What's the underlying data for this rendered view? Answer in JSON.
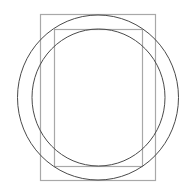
{
  "canvas": {
    "width": 192,
    "height": 194,
    "background": "#ffffff"
  },
  "colors": {
    "rect_stroke": "#a8a8a8",
    "circle_stroke": "#4a4a4a"
  },
  "shapes": {
    "outer_rect": {
      "x": 40.5,
      "y": 14.5,
      "width": 115,
      "height": 166
    },
    "inner_rect": {
      "x": 54.5,
      "y": 29.5,
      "width": 88,
      "height": 137
    },
    "outer_circle": {
      "cx": 98,
      "cy": 97.5,
      "rx": 80.5,
      "ry": 82.5
    },
    "inner_circle": {
      "cx": 98.5,
      "cy": 97.5,
      "rx": 66.5,
      "ry": 68.5
    }
  }
}
